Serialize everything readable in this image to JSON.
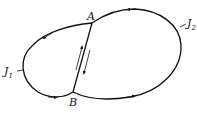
{
  "diagram": {
    "type": "closed curves sharing a common arc",
    "points": [
      {
        "id": "A",
        "label": "A",
        "x": 92,
        "y": 23
      },
      {
        "id": "B",
        "label": "B",
        "x": 73,
        "y": 92
      }
    ],
    "curves": [
      {
        "id": "J1",
        "label": "J",
        "subscript": "1",
        "region": "left lobe",
        "orientation": "counterclockwise"
      },
      {
        "id": "J2",
        "label": "J",
        "subscript": "2",
        "region": "right lobe",
        "orientation": "counterclockwise"
      }
    ],
    "common_arc": {
      "from": "A",
      "to": "B",
      "arrows": [
        "up",
        "down"
      ]
    },
    "colors": {
      "stroke": "#111111",
      "background": "#ffffff"
    }
  }
}
